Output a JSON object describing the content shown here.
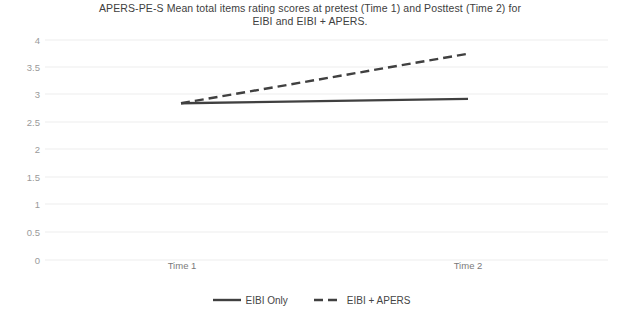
{
  "chart_data": {
    "type": "line",
    "title": "APERS-PE-S Mean total items rating scores at pretest (Time 1) and Posttest (Time 2) for EIBI and EIBI + APERS.",
    "title_lines": [
      "APERS-PE-S Mean total items rating scores at pretest (Time 1) and Posttest (Time 2) for",
      "EIBI and EIBI + APERS."
    ],
    "xlabel": "",
    "ylabel": "",
    "categories": [
      "Time 1",
      "Time 2"
    ],
    "x": [
      "Time 1",
      "Time 2"
    ],
    "ylim": [
      0,
      4
    ],
    "yticks": [
      4,
      3.5,
      3,
      2.5,
      2,
      1.5,
      1,
      0.5,
      0
    ],
    "ytick_labels": [
      "4",
      "3.5",
      "3",
      "2.5",
      "2",
      "1.5",
      "1",
      "0.5",
      "0"
    ],
    "grid": true,
    "grid_axis": "y",
    "grid_color": "#ededed",
    "legend_position": "bottom",
    "series": [
      {
        "name": "EIBI Only",
        "values": [
          2.85,
          2.93
        ],
        "style": "solid",
        "color": "#404040",
        "width": 2.4
      },
      {
        "name": "EIBI + APERS",
        "values": [
          2.85,
          3.75
        ],
        "style": "dashed",
        "color": "#404040",
        "width": 2.4,
        "dash": "9 5"
      }
    ]
  },
  "legend": {
    "entries": [
      {
        "label": "EIBI Only",
        "style": "solid"
      },
      {
        "label": "EIBI + APERS",
        "style": "dashed"
      }
    ]
  },
  "axes": {
    "y_labels": [
      "4",
      "3.5",
      "3",
      "2.5",
      "2",
      "1.5",
      "1",
      "0.5",
      "0"
    ],
    "x_labels": [
      "Time 1",
      "Time 2"
    ]
  }
}
